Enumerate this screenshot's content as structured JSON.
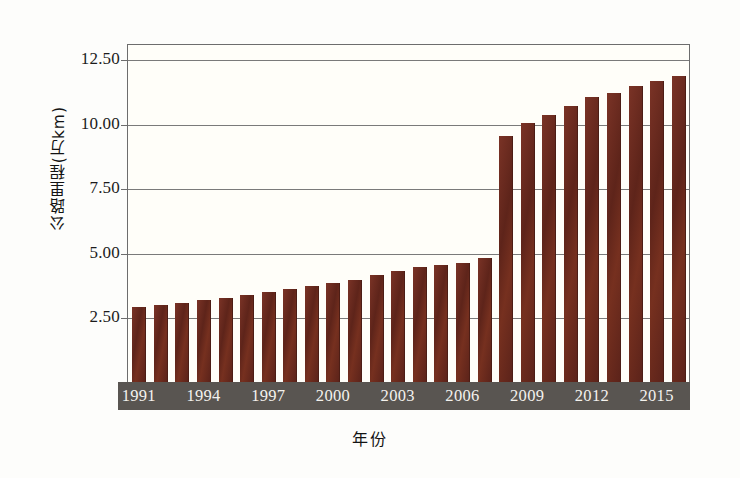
{
  "chart_data": {
    "type": "bar",
    "title": "",
    "xlabel": "年份",
    "ylabel": "公路里程(万km)",
    "ylim": [
      0,
      13.1
    ],
    "yticks": [
      2.5,
      5.0,
      7.5,
      10.0,
      12.5
    ],
    "ytick_labels": [
      "2.50",
      "5.00",
      "7.50",
      "10.00",
      "12.50"
    ],
    "grid": true,
    "legend": "none",
    "bar_color": "#6b2b20",
    "axis_band_color": "#595551",
    "categories": [
      "1991",
      "1992",
      "1993",
      "1994",
      "1995",
      "1996",
      "1997",
      "1998",
      "1999",
      "2000",
      "2001",
      "2002",
      "2003",
      "2004",
      "2005",
      "2006",
      "2007",
      "2008",
      "2009",
      "2010",
      "2011",
      "2012",
      "2013",
      "2014",
      "2015",
      "2016"
    ],
    "xtick_labels": [
      "1991",
      "1994",
      "1997",
      "2000",
      "2003",
      "2006",
      "2009",
      "2012",
      "2015"
    ],
    "values": [
      2.9,
      2.97,
      3.07,
      3.17,
      3.26,
      3.36,
      3.5,
      3.62,
      3.72,
      3.83,
      3.95,
      4.13,
      4.32,
      4.45,
      4.55,
      4.63,
      4.8,
      9.55,
      10.05,
      10.35,
      10.71,
      11.06,
      11.19,
      11.46,
      11.65,
      11.87
    ]
  }
}
